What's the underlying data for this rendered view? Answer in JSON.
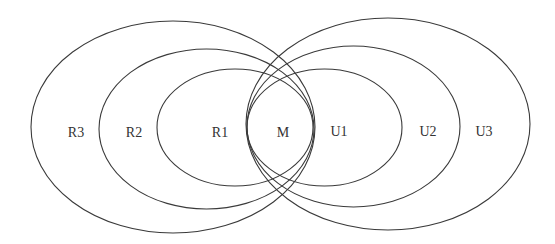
{
  "diagram": {
    "type": "nested-overlapping-ellipses",
    "stroke_color": "#3a3a3a",
    "label_color": "#333333",
    "background": "#ffffff",
    "ellipses": [
      {
        "id": "R3",
        "cx": 173,
        "cy": 127,
        "rx": 142,
        "ry": 106
      },
      {
        "id": "R2",
        "cx": 206.5,
        "cy": 129,
        "rx": 107.5,
        "ry": 80
      },
      {
        "id": "R1",
        "cx": 235,
        "cy": 127.5,
        "rx": 78,
        "ry": 58.5
      },
      {
        "id": "U1",
        "cx": 324.5,
        "cy": 127.5,
        "rx": 77.5,
        "ry": 58.5
      },
      {
        "id": "U2",
        "cx": 353.5,
        "cy": 126.5,
        "rx": 106.5,
        "ry": 80.5
      },
      {
        "id": "U3",
        "cx": 388,
        "cy": 124,
        "rx": 142,
        "ry": 106
      }
    ],
    "labels": {
      "r3": "R3",
      "r2": "R2",
      "r1": "R1",
      "m": "M",
      "u1": "U1",
      "u2": "U2",
      "u3": "U3"
    },
    "label_positions": {
      "r3": {
        "x": 76,
        "y": 132
      },
      "r2": {
        "x": 134,
        "y": 132
      },
      "r1": {
        "x": 220,
        "y": 132
      },
      "m": {
        "x": 283,
        "y": 132
      },
      "u1": {
        "x": 339,
        "y": 131
      },
      "u2": {
        "x": 428,
        "y": 131
      },
      "u3": {
        "x": 484,
        "y": 131
      }
    }
  }
}
